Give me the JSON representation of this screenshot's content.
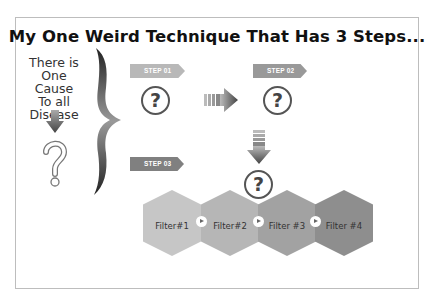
{
  "title": "My One Weird Technique That Has 3 Steps...",
  "left_panel": {
    "lines": [
      "There is",
      "One Cause",
      "To all",
      "Disease"
    ],
    "arrow_icon": "arrow-down-icon",
    "question_icon": "question-mark-icon"
  },
  "brace_icon": "curly-brace-icon",
  "steps": [
    {
      "label": "STEP 01",
      "color": "#b8b8b8"
    },
    {
      "label": "STEP 02",
      "color": "#999999"
    },
    {
      "label": "STEP 03",
      "color": "#808080"
    }
  ],
  "question_circles": [
    "?",
    "?",
    "?"
  ],
  "filters": [
    {
      "label": "Filter#1",
      "color": "#c6c6c6"
    },
    {
      "label": "Filter#2",
      "color": "#b6b6b6"
    },
    {
      "label": "Filter #3",
      "color": "#a2a2a2"
    },
    {
      "label": "Filter #4",
      "color": "#8e8e8e"
    }
  ],
  "colors": {
    "frame_border": "#bdbdbd",
    "arrow_dark": "#555555"
  }
}
